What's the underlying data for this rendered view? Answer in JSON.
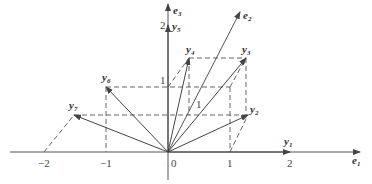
{
  "diagram": {
    "axes": {
      "e1": {
        "label": "e",
        "sub": "1"
      },
      "e2": {
        "label": "e",
        "sub": "2"
      },
      "e3": {
        "label": "e",
        "sub": "3"
      }
    },
    "ticks": {
      "x_neg2": "−2",
      "x_neg1": "−1",
      "origin": "0",
      "x_1": "1",
      "x_2": "2",
      "z_1": "1",
      "z_2": "2",
      "e2_1": "1"
    },
    "vectors": [
      {
        "name": "y",
        "sub": "1"
      },
      {
        "name": "y",
        "sub": "2"
      },
      {
        "name": "y",
        "sub": "3"
      },
      {
        "name": "y",
        "sub": "4"
      },
      {
        "name": "y",
        "sub": "5"
      },
      {
        "name": "y",
        "sub": "6"
      },
      {
        "name": "y",
        "sub": "7"
      }
    ],
    "colors": {
      "line": "#444444",
      "text": "#333333",
      "background": "#ffffff"
    }
  }
}
